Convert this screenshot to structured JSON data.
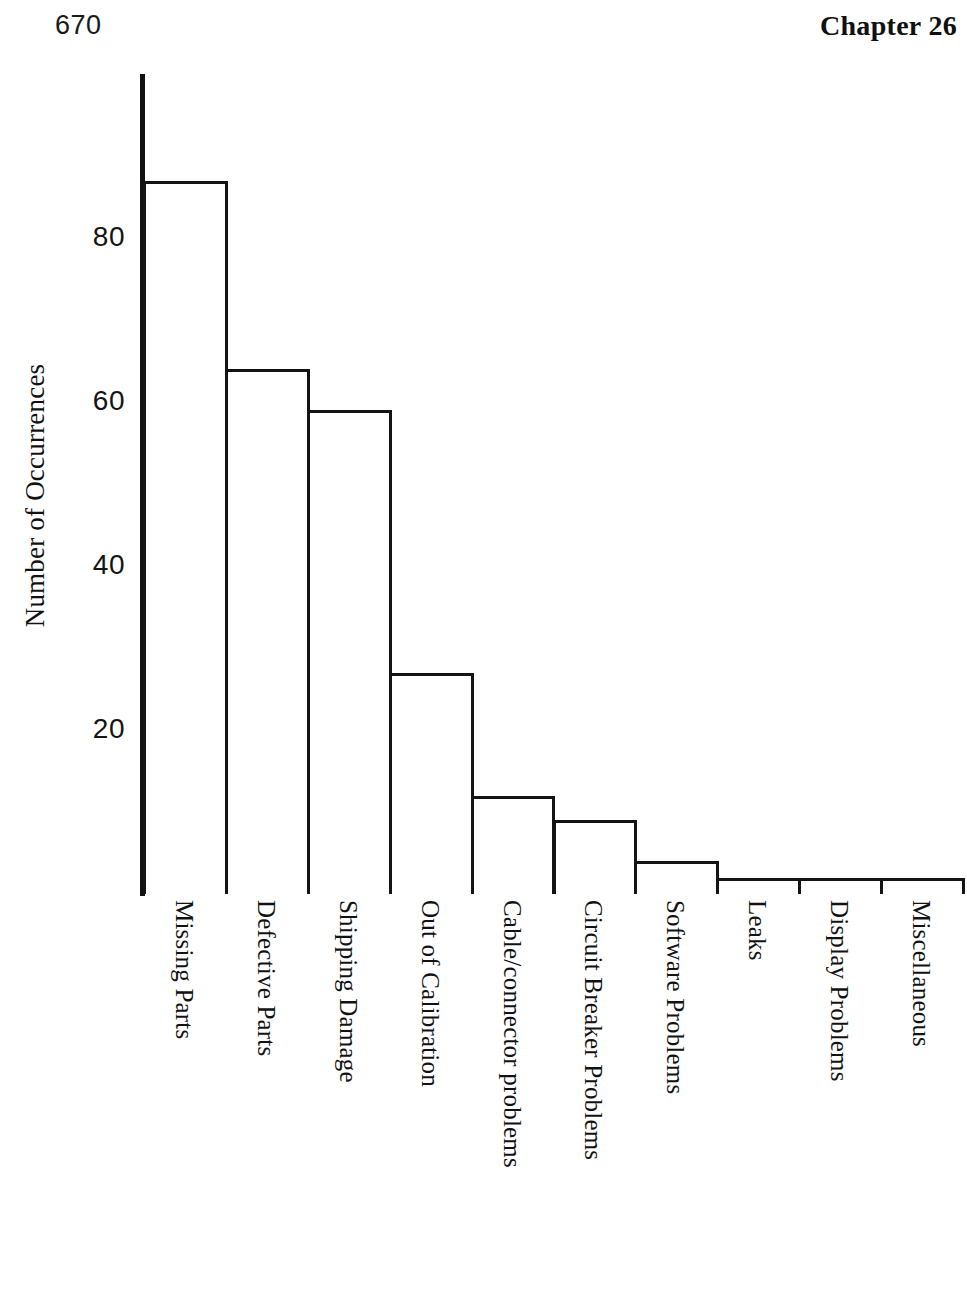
{
  "header": {
    "page_number": "670",
    "chapter_label": "Chapter 26"
  },
  "chart_data": {
    "type": "bar",
    "title": "",
    "subtitle": "",
    "xlabel": "",
    "ylabel": "Number of Occurrences",
    "ylim": [
      0,
      100
    ],
    "yticks": [
      20,
      40,
      60,
      80
    ],
    "ytick_labels": [
      "20",
      "40",
      "60",
      "80"
    ],
    "grid": false,
    "legend": false,
    "orientation": "vertical",
    "bar_style": "hollow-outline",
    "categories": [
      "Missing Parts",
      "Defective Parts",
      "Shipping Damage",
      "Out of Calibration",
      "Cable/connector problems",
      "Circuit Breaker Problems",
      "Software Problems",
      "Leaks",
      "Display Problems",
      "Miscellaneous"
    ],
    "values": [
      87,
      64,
      59,
      27,
      12,
      9,
      4,
      2,
      2,
      2
    ]
  }
}
